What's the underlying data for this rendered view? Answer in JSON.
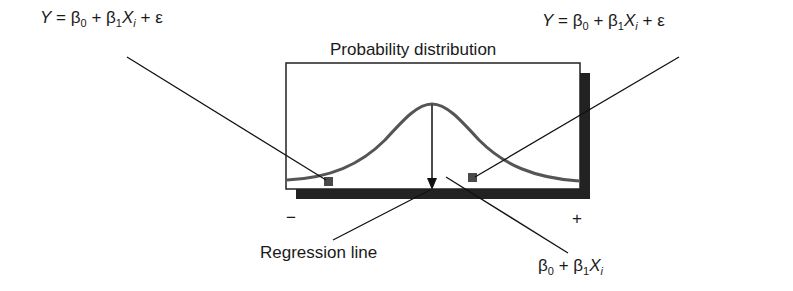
{
  "diagram": {
    "title": "Probability distribution",
    "left_equation": {
      "Y": "Y",
      "eq": "=",
      "beta": "β",
      "sub0": "0",
      "plus1": "+",
      "sub1": "1",
      "X": "X",
      "subi": "i",
      "plus2": "+",
      "epsilon": "ε"
    },
    "right_equation": {
      "Y": "Y",
      "eq": "=",
      "beta": "β",
      "sub0": "0",
      "plus1": "+",
      "sub1": "1",
      "X": "X",
      "subi": "i",
      "plus2": "+",
      "epsilon": "ε"
    },
    "regression_label": "Regression line",
    "mean_equation": {
      "beta": "β",
      "sub0": "0",
      "plus": "+",
      "sub1": "1",
      "X": "X",
      "subi": "i"
    },
    "axis_minus": "−",
    "axis_plus": "+",
    "colors": {
      "curve": "#555555",
      "points": "#4a4a4a",
      "lines": "#111111",
      "shadow": "#222222",
      "box_border": "#222222"
    }
  }
}
